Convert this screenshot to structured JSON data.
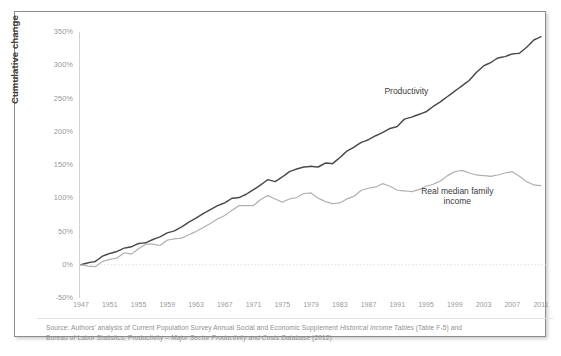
{
  "figure": {
    "ylabel": "Cumulative change",
    "frame_color": "#8c8c8c",
    "background": "#ffffff"
  },
  "source_note": {
    "prefix": "Source: ",
    "line1_a": "Authors' analysis of Current Population Survey Annual Social and Economic Supplement ",
    "line1_italic": "Historical Income Tables",
    "line1_b": " (Table F-5) and",
    "line2_a": "Bureau of Labor Statistics, Productivity – ",
    "line2_italic": "Major Sector Productivity and Costs Database",
    "line2_b": " (2012)"
  },
  "chart_data": {
    "type": "line",
    "title": "",
    "subtitle": "",
    "xlabel": "",
    "ylabel": "Cumulative change",
    "grid": false,
    "legend_position": "inline-annotation",
    "xlim": [
      1947,
      2011
    ],
    "ylim": [
      -50,
      350
    ],
    "ytick_labels": [
      "350%",
      "300%",
      "250%",
      "200%",
      "150%",
      "100%",
      "50%",
      "0%",
      "-50%"
    ],
    "ytick_values": [
      350,
      300,
      250,
      200,
      150,
      100,
      50,
      0,
      -50
    ],
    "xtick_labels": [
      "1947",
      "1951",
      "1955",
      "1959",
      "1963",
      "1967",
      "1971",
      "1975",
      "1979",
      "1983",
      "1987",
      "1991",
      "1995",
      "1999",
      "2003",
      "2007",
      "2011"
    ],
    "xtick_values": [
      1947,
      1951,
      1955,
      1959,
      1963,
      1967,
      1971,
      1975,
      1979,
      1983,
      1987,
      1991,
      1995,
      1999,
      2003,
      2007,
      2011
    ],
    "zero_line": 0,
    "annotations": [
      {
        "text": "Productivity",
        "x": 1997,
        "y": 258
      },
      {
        "text": "Real median family\nincome",
        "x": 2001,
        "y": 108
      }
    ],
    "series": [
      {
        "name": "Productivity",
        "color": "#4a4a4a",
        "label_line1": "Productivity",
        "label_line2": "",
        "x": [
          1947,
          1948,
          1949,
          1950,
          1951,
          1952,
          1953,
          1954,
          1955,
          1956,
          1957,
          1958,
          1959,
          1960,
          1961,
          1962,
          1963,
          1964,
          1965,
          1966,
          1967,
          1968,
          1969,
          1970,
          1971,
          1972,
          1973,
          1974,
          1975,
          1976,
          1977,
          1978,
          1979,
          1980,
          1981,
          1982,
          1983,
          1984,
          1985,
          1986,
          1987,
          1988,
          1989,
          1990,
          1991,
          1992,
          1993,
          1994,
          1995,
          1996,
          1997,
          1998,
          1999,
          2000,
          2001,
          2002,
          2003,
          2004,
          2005,
          2006,
          2007,
          2008,
          2009,
          2010,
          2011
        ],
        "values": [
          0,
          3,
          5,
          13,
          17,
          20,
          25,
          27,
          32,
          33,
          38,
          42,
          48,
          51,
          57,
          64,
          70,
          77,
          83,
          89,
          93,
          100,
          101,
          106,
          113,
          120,
          128,
          125,
          132,
          140,
          144,
          147,
          148,
          147,
          153,
          152,
          161,
          171,
          177,
          184,
          188,
          194,
          199,
          205,
          208,
          219,
          222,
          226,
          230,
          238,
          245,
          253,
          261,
          269,
          277,
          289,
          299,
          304,
          311,
          313,
          317,
          318,
          327,
          338,
          343
        ]
      },
      {
        "name": "Real median family income",
        "color": "#b0b0b0",
        "label_line1": "Real median family",
        "label_line2": "income",
        "x": [
          1947,
          1948,
          1949,
          1950,
          1951,
          1952,
          1953,
          1954,
          1955,
          1956,
          1957,
          1958,
          1959,
          1960,
          1961,
          1962,
          1963,
          1964,
          1965,
          1966,
          1967,
          1968,
          1969,
          1970,
          1971,
          1972,
          1973,
          1974,
          1975,
          1976,
          1977,
          1978,
          1979,
          1980,
          1981,
          1982,
          1983,
          1984,
          1985,
          1986,
          1987,
          1988,
          1989,
          1990,
          1991,
          1992,
          1993,
          1994,
          1995,
          1996,
          1997,
          1998,
          1999,
          2000,
          2001,
          2002,
          2003,
          2004,
          2005,
          2006,
          2007,
          2008,
          2009,
          2010,
          2011
        ],
        "values": [
          0,
          -2,
          -3,
          5,
          8,
          10,
          18,
          16,
          24,
          31,
          31,
          29,
          37,
          39,
          40,
          45,
          50,
          56,
          62,
          69,
          74,
          82,
          89,
          89,
          89,
          98,
          104,
          99,
          94,
          99,
          101,
          107,
          108,
          100,
          95,
          92,
          93,
          99,
          103,
          112,
          115,
          117,
          122,
          118,
          112,
          111,
          110,
          113,
          118,
          121,
          126,
          134,
          140,
          142,
          138,
          135,
          134,
          133,
          135,
          138,
          140,
          133,
          125,
          120,
          119
        ]
      }
    ]
  }
}
